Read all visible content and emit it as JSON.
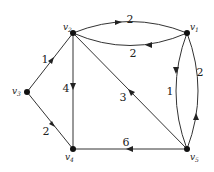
{
  "diagram": {
    "type": "directed-weighted-graph",
    "nodes": [
      {
        "id": "v1",
        "name": "v",
        "sub": "1",
        "x": 187,
        "y": 33
      },
      {
        "id": "v2",
        "name": "v",
        "sub": "2",
        "x": 73,
        "y": 33
      },
      {
        "id": "v3",
        "name": "v",
        "sub": "3",
        "x": 27,
        "y": 92
      },
      {
        "id": "v4",
        "name": "v",
        "sub": "4",
        "x": 73,
        "y": 149
      },
      {
        "id": "v5",
        "name": "v",
        "sub": "5",
        "x": 187,
        "y": 149
      }
    ],
    "edges": [
      {
        "from": "v2",
        "to": "v1",
        "weight": "2"
      },
      {
        "from": "v1",
        "to": "v2",
        "weight": "2"
      },
      {
        "from": "v3",
        "to": "v2",
        "weight": "1"
      },
      {
        "from": "v2",
        "to": "v4",
        "weight": "4"
      },
      {
        "from": "v5",
        "to": "v2",
        "weight": "3"
      },
      {
        "from": "v3",
        "to": "v4",
        "weight": "2"
      },
      {
        "from": "v5",
        "to": "v4",
        "weight": "6"
      },
      {
        "from": "v1",
        "to": "v5",
        "weight": "1"
      },
      {
        "from": "v5",
        "to": "v1",
        "weight": "2"
      }
    ]
  }
}
